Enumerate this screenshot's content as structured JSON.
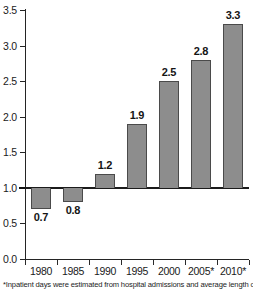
{
  "chart_data": {
    "type": "bar",
    "title": "",
    "subtitle": "",
    "xlabel": "",
    "ylabel": "",
    "categories": [
      "1980",
      "1985",
      "1990",
      "1995",
      "2000",
      "2005*",
      "2010*"
    ],
    "values": [
      0.7,
      0.8,
      1.2,
      1.9,
      2.5,
      2.8,
      3.3
    ],
    "data_labels": [
      "0.7",
      "0.8",
      "1.2",
      "1.9",
      "2.5",
      "2.8",
      "3.3"
    ],
    "ylim": [
      0.0,
      3.5
    ],
    "ytick_values": [
      0.0,
      0.5,
      1.0,
      1.5,
      2.0,
      2.5,
      3.0,
      3.5
    ],
    "ytick_labels": [
      "0.0",
      "0.5",
      "1.0",
      "1.5",
      "2.0",
      "2.5",
      "3.0",
      "3.5"
    ],
    "baseline": 1.0,
    "grid": false,
    "legend": "none",
    "bar_color": "#8d8d8d",
    "bar_border_color": "#4a4a4a",
    "axis_color": "#242424",
    "text_color": "#1a1a1a"
  },
  "footnote": {
    "text": "*Inpatient days were estimated from hospital admissions and average length of stay."
  }
}
